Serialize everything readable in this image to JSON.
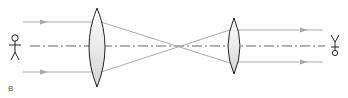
{
  "diagram": {
    "type": "optics-ray-diagram",
    "label": "B",
    "colors": {
      "ray": "#aaaaaa",
      "axis": "#666666",
      "lens_stroke": "#222222",
      "lens_fill": "#e6e6e6",
      "figure": "#222222"
    },
    "elements": {
      "object": "stick-figure",
      "objective_lens": "large-convex-lens",
      "focal_point": "ray-crossing",
      "eyepiece_lens": "small-convex-lens",
      "observer": "eye-symbol"
    }
  }
}
